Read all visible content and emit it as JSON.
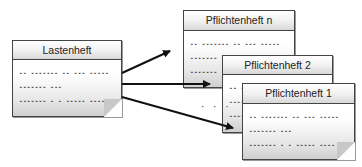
{
  "diagram": {
    "source": {
      "title": "Lastenheft",
      "lines": [
        "-- ------- -- --- -----",
        "------- ---",
        "------- - - ----- ----"
      ]
    },
    "targets": [
      {
        "title": "Pflichtenheft   n",
        "lines": [
          "-- ------- -- --- -----",
          "------- ---",
          "------- - - ----- ----"
        ]
      },
      {
        "title": "Pflichtenheft   2",
        "lines": [
          "-- ------- -- --- -----",
          "------- ---",
          "------- - - ----- ----"
        ]
      },
      {
        "title": "Pflichtenheft   1",
        "lines": [
          "-- ------- -- --- -----",
          "------- ---",
          "------- - - ----- ----"
        ]
      }
    ],
    "ellipsis": "· · ·",
    "edges": [
      {
        "from": "Lastenheft",
        "to": "Pflichtenheft n"
      },
      {
        "from": "Lastenheft",
        "to": "Pflichtenheft 2"
      },
      {
        "from": "Lastenheft",
        "to": "Pflichtenheft 1"
      }
    ]
  }
}
